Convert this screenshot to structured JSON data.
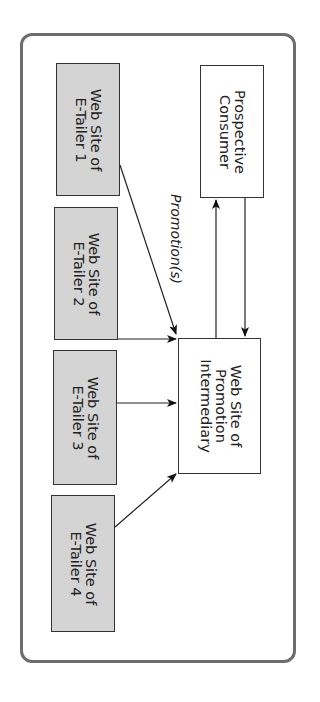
{
  "diagram": {
    "nodes": {
      "consumer": {
        "line1": "Prospective",
        "line2": "Consumer"
      },
      "intermediary": {
        "line1": "Web Site of",
        "line2": "Promotion",
        "line3": "Intermediary"
      },
      "etailers": [
        {
          "line1": "Web Site of",
          "line2": "E-Tailer 1"
        },
        {
          "line1": "Web Site of",
          "line2": "E-Tailer 2"
        },
        {
          "line1": "Web Site of",
          "line2": "E-Tailer 3"
        },
        {
          "line1": "Web Site of",
          "line2": "E-Tailer 4"
        }
      ]
    },
    "edge_label": "Promotion(s)",
    "colors": {
      "frame": "#6d6d6d",
      "etailer_fill": "#d4d4d4",
      "line": "#222222"
    }
  }
}
